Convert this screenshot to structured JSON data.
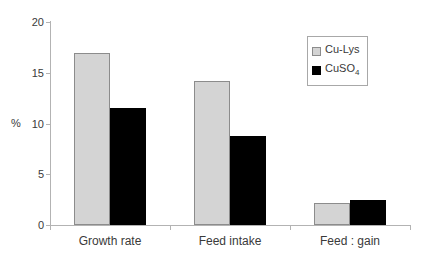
{
  "chart_data": {
    "type": "bar",
    "title": "",
    "categories": [
      "Growth rate",
      "Feed intake",
      "Feed : gain"
    ],
    "series": [
      {
        "name": "Cu-Lys",
        "legend_main": "Cu-Lys",
        "legend_sub": "",
        "fill": "#d4d4d4",
        "border": "#8c8c8c",
        "values": [
          16.9,
          14.2,
          2.2
        ]
      },
      {
        "name": "CuSO4",
        "legend_main": "CuSO",
        "legend_sub": "4",
        "fill": "#000000",
        "border": "#000000",
        "values": [
          11.5,
          8.8,
          2.5
        ]
      }
    ],
    "xlabel": "",
    "ylabel": "%",
    "ylim": [
      0,
      20
    ],
    "yticks": [
      0,
      5,
      10,
      15,
      20
    ],
    "grid": false,
    "legend_position": "top-right"
  },
  "colors": {
    "axis": "#b3b3b3",
    "text": "#3a3a3a",
    "legend_border": "#a8a8a8",
    "background": "#ffffff"
  }
}
